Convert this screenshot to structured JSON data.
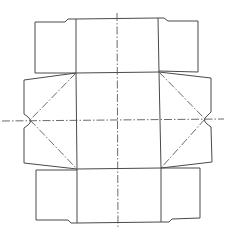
{
  "diagram": {
    "type": "packaging-net",
    "colors": {
      "line": "#4a4a4a",
      "background": "#ffffff"
    },
    "legend": {
      "cut_line": "solid",
      "fold_line": "dash-dot"
    },
    "panels": [
      {
        "id": "top-panel",
        "label": ""
      },
      {
        "id": "top-left-flap",
        "label": ""
      },
      {
        "id": "top-right-flap",
        "label": ""
      },
      {
        "id": "base-panel",
        "label": ""
      },
      {
        "id": "left-side-flap",
        "label": ""
      },
      {
        "id": "right-side-flap",
        "label": ""
      },
      {
        "id": "bottom-panel",
        "label": ""
      },
      {
        "id": "bottom-left-flap",
        "label": ""
      },
      {
        "id": "bottom-right-flap",
        "label": ""
      }
    ]
  }
}
